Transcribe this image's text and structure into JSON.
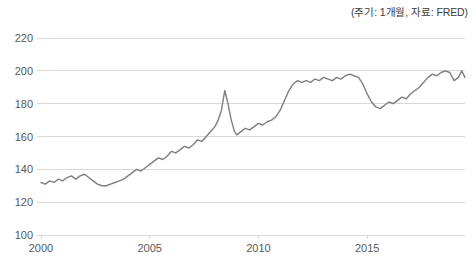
{
  "annotation": "(주기: 1개월, 자료: FRED)",
  "colors": {
    "line": "#7f7f7f",
    "grid": "#d9d9d9",
    "axis": "#d9d9d9",
    "tick_text": "#595959",
    "annotation_text": "#3b3b3b",
    "background": "#ffffff"
  },
  "chart_data": {
    "type": "line",
    "title": "",
    "subtitle": "",
    "xlabel": "",
    "ylabel": "",
    "xlim": [
      2000.0,
      2019.5
    ],
    "ylim": [
      100,
      220
    ],
    "yticks": [
      100,
      120,
      140,
      160,
      180,
      200,
      220
    ],
    "xticks": [
      2000,
      2005,
      2010,
      2015
    ],
    "xtick_labels": [
      "2000",
      "2005",
      "2010",
      "2015"
    ],
    "ytick_labels": [
      "100",
      "120",
      "140",
      "160",
      "180",
      "200",
      "220"
    ],
    "grid": true,
    "grid_axis": "y",
    "legend": false,
    "legend_position": "none",
    "annotations": [
      "(주기: 1개월, 자료: FRED)"
    ],
    "series": [
      {
        "name": "index",
        "color": "#7f7f7f",
        "x": [
          2000.0,
          2000.2,
          2000.4,
          2000.6,
          2000.8,
          2001.0,
          2001.2,
          2001.4,
          2001.6,
          2001.8,
          2002.0,
          2002.2,
          2002.4,
          2002.6,
          2002.8,
          2003.0,
          2003.2,
          2003.4,
          2003.6,
          2003.8,
          2004.0,
          2004.2,
          2004.4,
          2004.6,
          2004.8,
          2005.0,
          2005.2,
          2005.4,
          2005.6,
          2005.8,
          2006.0,
          2006.2,
          2006.4,
          2006.6,
          2006.8,
          2007.0,
          2007.2,
          2007.4,
          2007.6,
          2007.8,
          2008.0,
          2008.15,
          2008.3,
          2008.45,
          2008.6,
          2008.75,
          2008.9,
          2009.0,
          2009.2,
          2009.4,
          2009.6,
          2009.8,
          2010.0,
          2010.2,
          2010.4,
          2010.6,
          2010.8,
          2011.0,
          2011.2,
          2011.4,
          2011.6,
          2011.8,
          2012.0,
          2012.2,
          2012.4,
          2012.6,
          2012.8,
          2013.0,
          2013.2,
          2013.4,
          2013.6,
          2013.8,
          2014.0,
          2014.2,
          2014.4,
          2014.6,
          2014.8,
          2015.0,
          2015.2,
          2015.4,
          2015.6,
          2015.8,
          2016.0,
          2016.2,
          2016.4,
          2016.6,
          2016.8,
          2017.0,
          2017.2,
          2017.4,
          2017.6,
          2017.8,
          2018.0,
          2018.2,
          2018.4,
          2018.6,
          2018.8,
          2019.0,
          2019.2,
          2019.35,
          2019.5
        ],
        "y": [
          132,
          131,
          133,
          132,
          134,
          133,
          135,
          136,
          134,
          136,
          137,
          135,
          133,
          131,
          130,
          130,
          131,
          132,
          133,
          134,
          136,
          138,
          140,
          139,
          141,
          143,
          145,
          147,
          146,
          148,
          151,
          150,
          152,
          154,
          153,
          155,
          158,
          157,
          160,
          163,
          166,
          170,
          176,
          188,
          180,
          170,
          163,
          161,
          163,
          165,
          164,
          166,
          168,
          167,
          169,
          170,
          172,
          176,
          182,
          188,
          192,
          194,
          193,
          194,
          193,
          195,
          194,
          196,
          195,
          194,
          196,
          195,
          197,
          198,
          197,
          196,
          192,
          186,
          181,
          178,
          177,
          179,
          181,
          180,
          182,
          184,
          183,
          186,
          188,
          190,
          193,
          196,
          198,
          197,
          199,
          200,
          199,
          194,
          196,
          200,
          196
        ]
      }
    ]
  }
}
